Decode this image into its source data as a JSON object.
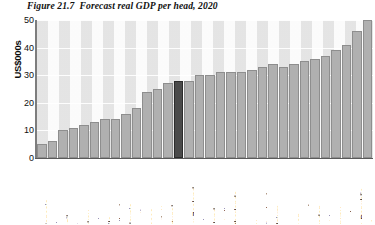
{
  "title": {
    "figure_number": "Figure 21.7",
    "caption": "Forecast real GDP per head, 2020",
    "full": "Figure 21.7  Forecast real GDP per head, 2020"
  },
  "colors": {
    "bar_fill": "#b0b0b0",
    "bar_stroke": "#8e8e8e",
    "highlight_fill": "#4a4a4a",
    "highlight_stroke": "#2c2c2c",
    "stripe_dark": "#e3e3e3",
    "stripe_light": "#fbfbfb",
    "gridline": "#ffffff",
    "axis": "#5a5a5a"
  },
  "chart_data": {
    "type": "bar",
    "title": "Forecast real GDP per head, 2020",
    "xlabel": "",
    "ylabel": "US$000s",
    "ylim": [
      0,
      50
    ],
    "yticks": [
      0,
      10,
      20,
      30,
      40,
      50
    ],
    "ytick_labels": [
      "0",
      "10",
      "20",
      "30",
      "40",
      "50"
    ],
    "grid": true,
    "legend": "none",
    "highlight_category": "UK",
    "categories": [
      "Indonesia",
      "India",
      "Brazil",
      "China",
      "Turkey",
      "Mexico",
      "Chile",
      "Thailand",
      "Malaysia",
      "Argentina",
      "Greece",
      "South Korea",
      "Portugal",
      "UK",
      "New Zealand",
      "Spain",
      "Finland",
      "Australia",
      "Netherlands",
      "Germany",
      "Italy",
      "Switzerland",
      "Belgium",
      "France",
      "Japan",
      "Denmark",
      "Sweden",
      "Austria",
      "Norway",
      "Canada",
      "rish Republic",
      "USA"
    ],
    "values": [
      5,
      6,
      10,
      11,
      12,
      13,
      14,
      14,
      16,
      18,
      24,
      25,
      27,
      28,
      28,
      30,
      30,
      31,
      31,
      31,
      32,
      33,
      34,
      33,
      34,
      35,
      36,
      37,
      39,
      41,
      46,
      50
    ]
  },
  "axis": {
    "y_label": "US$000s"
  }
}
